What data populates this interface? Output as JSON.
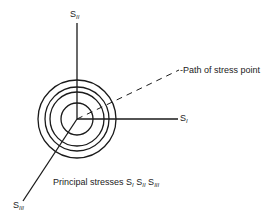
{
  "diagram": {
    "axes": [
      {
        "id": "s1",
        "label": "S",
        "subscript": "I"
      },
      {
        "id": "s2",
        "label": "S",
        "subscript": "II"
      },
      {
        "id": "s3",
        "label": "S",
        "subscript": "III"
      }
    ],
    "path_label": "-Path of stress point",
    "caption": {
      "prefix": "Principal stresses ",
      "terms": [
        {
          "label": "S",
          "subscript": "I"
        },
        {
          "label": "S",
          "subscript": "II"
        },
        {
          "label": "S",
          "subscript": "III"
        }
      ]
    },
    "circles": {
      "count": 4,
      "radii": [
        16,
        27,
        32,
        39
      ]
    },
    "colors": {
      "line": "#1a1a1a",
      "background": "#ffffff"
    }
  }
}
